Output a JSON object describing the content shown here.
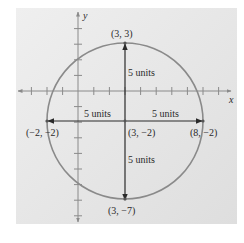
{
  "figure": {
    "background_color": "#e6e6e6",
    "circle_color": "#8a8a8a",
    "axis_color": "#7a7a7a",
    "arrow_color": "#2a2a2a",
    "axes": {
      "x_label": "x",
      "y_label": "y"
    },
    "center": {
      "label": "(3, −2)",
      "x": 3,
      "y": -2
    },
    "radius": 5,
    "points": [
      {
        "name": "top",
        "label": "(3, 3)",
        "x": 3,
        "y": 3
      },
      {
        "name": "bottom",
        "label": "(3, −7)",
        "x": 3,
        "y": -7
      },
      {
        "name": "left",
        "label": "(−2, −2)",
        "x": -2,
        "y": -2
      },
      {
        "name": "right",
        "label": "(8, −2)",
        "x": 8,
        "y": -2
      }
    ],
    "radius_labels": {
      "up": "5 units",
      "down": "5 units",
      "left": "5 units",
      "right": "5 units"
    }
  }
}
